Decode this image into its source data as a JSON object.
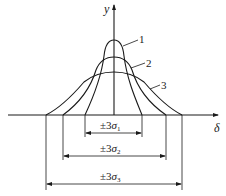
{
  "diagram": {
    "axes": {
      "y_label": "y",
      "x_label": "δ"
    },
    "curves": [
      {
        "id": "1",
        "label": "1",
        "half_width_3sigma": "±3σ₁"
      },
      {
        "id": "2",
        "label": "2",
        "half_width_3sigma": "±3σ₂"
      },
      {
        "id": "3",
        "label": "3",
        "half_width_3sigma": "±3σ₃"
      }
    ],
    "dimensions": {
      "d1": {
        "prefix": "±3",
        "sym": "σ",
        "sub": "1"
      },
      "d2": {
        "prefix": "±3",
        "sym": "σ",
        "sub": "2"
      },
      "d3": {
        "prefix": "±3",
        "sym": "σ",
        "sub": "3"
      }
    },
    "colors": {
      "line": "#1a1a1a",
      "background": "#ffffff"
    }
  }
}
